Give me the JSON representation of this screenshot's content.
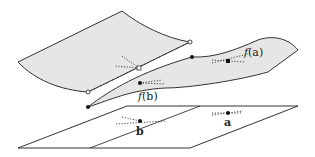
{
  "diagram": {
    "labels": {
      "fa_func": "f",
      "fa_arg": "(a)",
      "fb_func": "f",
      "fb_arg": "(b)",
      "a": "a",
      "b": "b"
    },
    "colors": {
      "surface_fill": "#e6e6e6",
      "stroke": "#333333",
      "plane_fill": "#ffffff"
    }
  }
}
